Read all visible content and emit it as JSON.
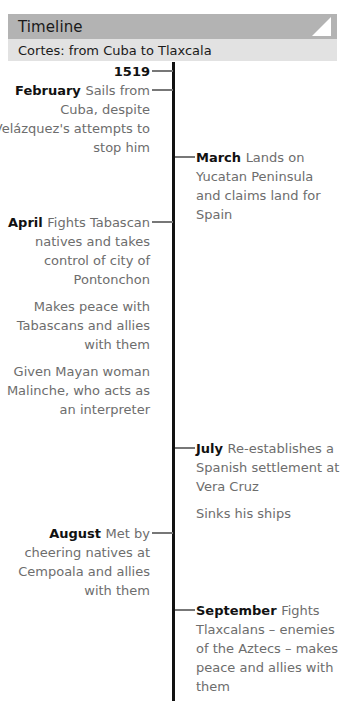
{
  "header": {
    "title": "Timeline",
    "subtitle": "Cortes: from Cuba to Tlaxcala",
    "title_bar_color": "#b3b3b3",
    "subtitle_bar_color": "#e2e2e2",
    "corner_icon": "folded-corner-triangle-icon"
  },
  "timeline": {
    "axis_color": "#111111",
    "label_color": "#111111",
    "body_color": "#6d6d6d",
    "year": "1519",
    "entries": [
      {
        "side": "left",
        "label": "February",
        "paragraphs": [
          "Sails from Cuba, despite Velázquez's attempts to stop him"
        ]
      },
      {
        "side": "right",
        "label": "March",
        "paragraphs": [
          "Lands on Yucatan Peninsula and claims land for Spain"
        ]
      },
      {
        "side": "left",
        "label": "April",
        "paragraphs": [
          "Fights Tabascan natives and takes control of city of Pontonchon",
          "Makes peace with Tabascans and allies with them",
          "Given Mayan woman Malinche, who acts as an interpreter"
        ]
      },
      {
        "side": "right",
        "label": "July",
        "paragraphs": [
          "Re-establishes a Spanish settlement at Vera Cruz",
          "Sinks his ships"
        ]
      },
      {
        "side": "left",
        "label": "August",
        "paragraphs": [
          "Met by cheering natives at Cempoala and allies with them"
        ]
      },
      {
        "side": "right",
        "label": "September",
        "paragraphs": [
          "Fights Tlaxcalans – enemies of the Aztecs – makes peace and allies with them"
        ]
      }
    ]
  }
}
